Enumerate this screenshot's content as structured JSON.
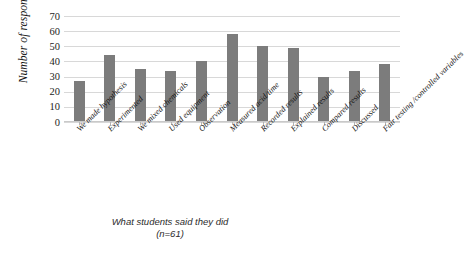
{
  "chart_data": {
    "type": "bar",
    "title": "",
    "xlabel": "",
    "ylabel": "Number of responses",
    "ylim": [
      0,
      70
    ],
    "ytick_step": 10,
    "yticks": [
      70,
      60,
      50,
      40,
      30,
      20,
      10,
      0
    ],
    "grid": true,
    "legend": "none",
    "bar_color": "#7c7c7c",
    "gridline_color": "#d8d8d8",
    "categories": [
      "We made hypothesis",
      "Experimented",
      "We mixed chemicals",
      "Used equipment",
      "Observation",
      "Measured acid/time",
      "Recorded results",
      "Explained results",
      "Compared results",
      "Discussed",
      "Fair testing /controlled variables"
    ],
    "values": [
      27,
      44,
      35,
      34,
      40,
      58,
      50,
      49,
      30,
      34,
      38
    ]
  },
  "caption": {
    "line1": "What students said they did",
    "line2": "(n=61)"
  }
}
